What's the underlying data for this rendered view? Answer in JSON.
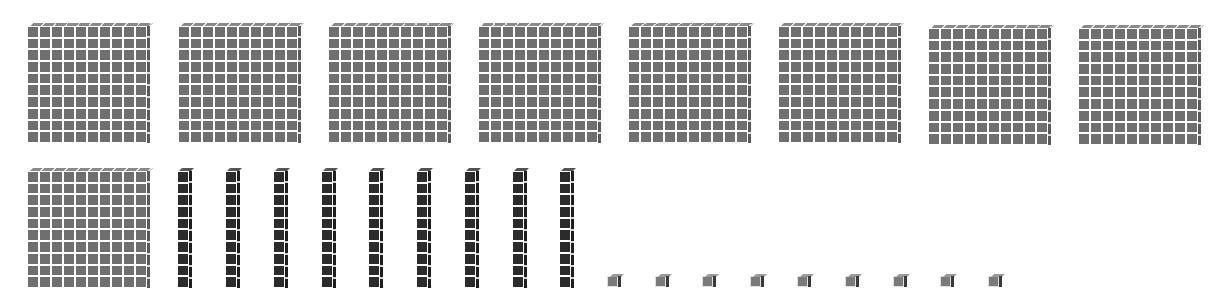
{
  "diagram": {
    "type": "base-ten-blocks",
    "represented_value": 999,
    "groups": [
      {
        "name": "hundreds",
        "block": "flat",
        "count": 9,
        "color": "#6f6f6f",
        "positions": [
          [
            27,
            26
          ],
          [
            178,
            26
          ],
          [
            328,
            26
          ],
          [
            478,
            26
          ],
          [
            628,
            26
          ],
          [
            778,
            26
          ],
          [
            928,
            28
          ],
          [
            1078,
            28
          ],
          [
            27,
            171
          ]
        ]
      },
      {
        "name": "tens",
        "block": "rod",
        "count": 9,
        "color": "#2b2b2b",
        "positions": [
          [
            177,
            171
          ],
          [
            225,
            171
          ],
          [
            273,
            171
          ],
          [
            321,
            171
          ],
          [
            368,
            171
          ],
          [
            416,
            171
          ],
          [
            464,
            171
          ],
          [
            512,
            171
          ],
          [
            559,
            171
          ]
        ]
      },
      {
        "name": "ones",
        "block": "unit",
        "count": 9,
        "color": "#7a7a7a",
        "positions": [
          [
            607,
            276
          ],
          [
            655,
            276
          ],
          [
            702,
            276
          ],
          [
            750,
            276
          ],
          [
            797,
            276
          ],
          [
            845,
            276
          ],
          [
            893,
            276
          ],
          [
            940,
            276
          ],
          [
            988,
            276
          ]
        ]
      }
    ]
  }
}
